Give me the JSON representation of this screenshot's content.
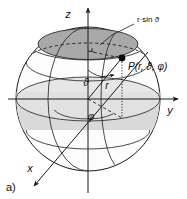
{
  "figure": {
    "panel_label": "a)",
    "background_color": "#ffffff",
    "ink_color": "#1a1a1a",
    "cap_fill_color": "#a8a8a8",
    "band_fill_color": "#d8d8d8",
    "sphere_fill_color": "#fdfdfd"
  },
  "axes": {
    "z": {
      "label": "z"
    },
    "y": {
      "label": "y"
    },
    "x": {
      "label": "x"
    }
  },
  "point": {
    "label": "P(r, ϑ, φ)",
    "marker": "filled-dot"
  },
  "radius": {
    "label": "r"
  },
  "angles": {
    "polar": {
      "label": "ϑ"
    },
    "azimuth": {
      "label": "φ"
    }
  },
  "annotations": {
    "projection_radius": {
      "label": "r·sin ϑ"
    },
    "right_angle": {
      "label": "right-angle-mark"
    }
  }
}
